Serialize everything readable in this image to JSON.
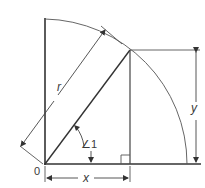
{
  "diagram": {
    "type": "geometry",
    "labels": {
      "radius": "r",
      "horizontal": "x",
      "vertical": "y",
      "angle": "∠1",
      "origin": "0"
    },
    "colors": {
      "line": "#333333",
      "thin_line": "#555555",
      "text": "#3a3a3a",
      "background": "#ffffff"
    }
  }
}
